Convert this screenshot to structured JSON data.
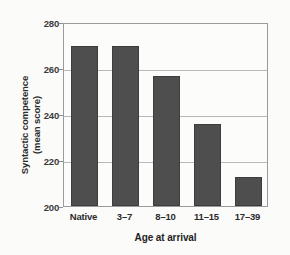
{
  "chart_data": {
    "type": "bar",
    "title": "",
    "categories": [
      "Native",
      "3–7",
      "8–10",
      "11–15",
      "17–39"
    ],
    "values": [
      269.5,
      269.5,
      256.5,
      235.5,
      212.5
    ],
    "xlabel": "Age at arrival",
    "ylabel": "Syntactic competence (mean score)",
    "ylabel_lines": [
      "Syntactic competence",
      "(mean score)"
    ],
    "ylim": [
      200,
      280
    ],
    "yticks": [
      200,
      220,
      240,
      260,
      280
    ],
    "ytick_labels": [
      "200",
      "220",
      "240",
      "260",
      "280"
    ],
    "grid": true,
    "legend": "none",
    "bar_color": "#4e4e4e",
    "grid_color": "#b9b9b9",
    "frame_color": "#9a9a9a",
    "background_color": "#fbfbfa"
  }
}
